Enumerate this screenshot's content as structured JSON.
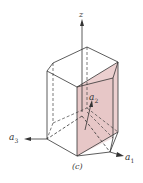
{
  "figure": {
    "caption": "(c)",
    "axes": {
      "z": {
        "label": "z"
      },
      "a1": {
        "label": "a",
        "subscript": "1"
      },
      "a2": {
        "label": "a",
        "subscript": "2"
      },
      "a3": {
        "label": "a",
        "subscript": "3"
      }
    },
    "colors": {
      "plane_fill": "#e8c9c9",
      "edge": "#333333",
      "background": "#ffffff"
    }
  }
}
